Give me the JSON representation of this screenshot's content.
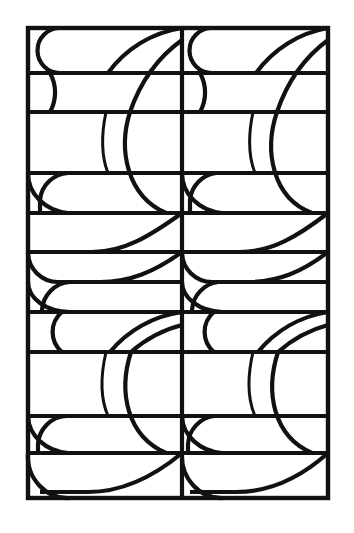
{
  "figure": {
    "title": "Interlocking arc lattice pattern",
    "kind": "line-art-geometric-pattern",
    "canvas": {
      "width": 354,
      "height": 533,
      "background": "#ffffff"
    },
    "ink_color": "#111111",
    "frame": {
      "x": 28,
      "y": 28,
      "width": 300,
      "height": 470
    },
    "columns": 2,
    "column_divider_x": 182,
    "modules_per_column": 4,
    "horizontal_grid_y": [
      28,
      73,
      112,
      173,
      213,
      252,
      312,
      352,
      416,
      453,
      498
    ]
  },
  "chart_data": {
    "type": "line",
    "title": "Interlocking arc lattice pattern",
    "xlabel": "",
    "ylabel": "",
    "grid": true,
    "legend_position": "none",
    "xlim": [
      0,
      354
    ],
    "ylim": [
      0,
      533
    ],
    "panels": [
      {
        "name": "left-column",
        "x_range": [
          28,
          182
        ]
      },
      {
        "name": "right-column",
        "x_range": [
          182,
          328
        ]
      }
    ],
    "horizontal_rules": [
      {
        "y": 28,
        "x0": 28,
        "x1": 328,
        "weight": "frame"
      },
      {
        "y": 73,
        "x0": 28,
        "x1": 328,
        "weight": "grid"
      },
      {
        "y": 112,
        "x0": 28,
        "x1": 328,
        "weight": "grid"
      },
      {
        "y": 173,
        "x0": 28,
        "x1": 328,
        "weight": "grid"
      },
      {
        "y": 213,
        "x0": 28,
        "x1": 328,
        "weight": "grid"
      },
      {
        "y": 252,
        "x0": 28,
        "x1": 328,
        "weight": "grid"
      },
      {
        "y": 312,
        "x0": 28,
        "x1": 328,
        "weight": "grid"
      },
      {
        "y": 352,
        "x0": 28,
        "x1": 328,
        "weight": "grid"
      },
      {
        "y": 416,
        "x0": 28,
        "x1": 328,
        "weight": "grid"
      },
      {
        "y": 453,
        "x0": 28,
        "x1": 328,
        "weight": "grid"
      },
      {
        "y": 498,
        "x0": 28,
        "x1": 328,
        "weight": "frame"
      }
    ],
    "vertical_rules": [
      {
        "x": 28,
        "y0": 28,
        "y1": 498,
        "weight": "frame"
      },
      {
        "x": 182,
        "y0": 28,
        "y1": 498,
        "weight": "grid"
      },
      {
        "x": 328,
        "y0": 28,
        "y1": 498,
        "weight": "frame"
      }
    ],
    "arc_families": [
      {
        "name": "stadium-caps",
        "count": 8,
        "radius_px": 22
      },
      {
        "name": "large-arcs",
        "count": 16,
        "radius_px": 82
      },
      {
        "name": "inner-arcs",
        "count": 8,
        "radius_px": 62
      }
    ]
  }
}
